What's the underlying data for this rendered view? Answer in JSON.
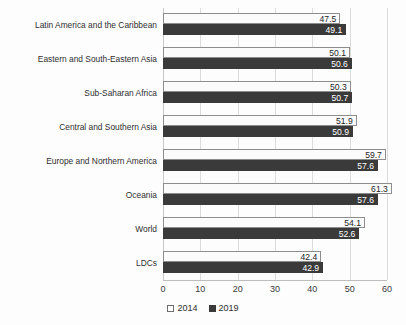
{
  "chart_data": {
    "type": "bar",
    "orientation": "horizontal",
    "title": "",
    "xlabel": "",
    "ylabel": "",
    "xlim": [
      0,
      60
    ],
    "xticks": [
      0,
      10,
      20,
      30,
      40,
      50,
      60
    ],
    "grid": true,
    "legend_position": "bottom",
    "categories": [
      "Latin America and the Caribbean",
      "Eastern and South-Eastern Asia",
      "Sub-Saharan Africa",
      "Central and Southern Asia",
      "Europe and Northern America",
      "Oceania",
      "World",
      "LDCs"
    ],
    "series": [
      {
        "name": "2014",
        "color": "#fbfbfb",
        "values": [
          47.5,
          50.1,
          50.3,
          51.9,
          59.7,
          61.3,
          54.1,
          42.4
        ]
      },
      {
        "name": "2019",
        "color": "#3a3a3a",
        "values": [
          49.1,
          50.6,
          50.7,
          50.9,
          57.6,
          57.6,
          52.6,
          42.9
        ]
      }
    ]
  },
  "legend": {
    "items": [
      {
        "label": "2014",
        "swatch": "hollow-square-icon"
      },
      {
        "label": "2019",
        "swatch": "filled-square-icon"
      }
    ]
  }
}
